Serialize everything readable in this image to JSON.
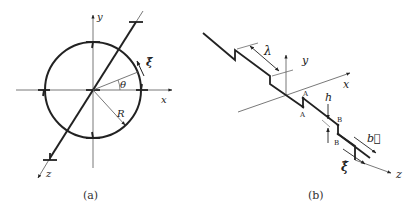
{
  "figure_a": {
    "caption": "(a)",
    "labels": {
      "y_axis": "y",
      "x_axis": "x",
      "z_axis": "z",
      "xi_hat": "ξ̂",
      "theta": "θ",
      "radius": "R"
    }
  },
  "figure_b": {
    "caption": "(b)",
    "labels": {
      "lambda": "λ",
      "y_axis": "y",
      "x_axis": "x",
      "z_axis": "z",
      "h": "h",
      "point_a_top": "A",
      "point_a_bottom": "A",
      "point_b_top": "B",
      "point_b_bottom": "B",
      "burgers_vector": "b⃗",
      "xi_hat": "ξ̂"
    }
  },
  "colors": {
    "line": "#222222",
    "thin_line": "#555555",
    "background": "#ffffff"
  }
}
